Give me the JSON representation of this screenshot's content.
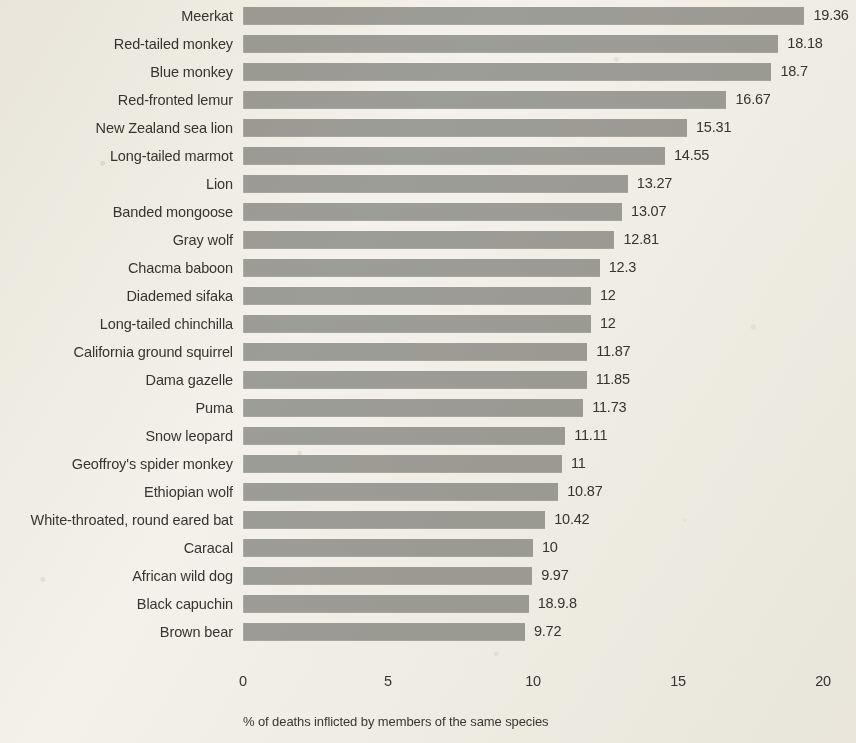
{
  "chart_data": {
    "type": "bar",
    "orientation": "horizontal",
    "title": "",
    "xlabel": "% of deaths inflicted by members of the same species",
    "ylabel": "",
    "xlim": [
      0,
      20
    ],
    "xticks": [
      "0",
      "5",
      "10",
      "15",
      "20"
    ],
    "grid": false,
    "legend": null,
    "bar_color": "#9d9d97",
    "background_color": "#f3f1ea",
    "categories": [
      "Meerkat",
      "Red-tailed monkey",
      "Blue monkey",
      "Red-fronted lemur",
      "New Zealand sea lion",
      "Long-tailed marmot",
      "Lion",
      "Banded mongoose",
      "Gray wolf",
      "Chacma baboon",
      "Diademed sifaka",
      "Long-tailed chinchilla",
      "California ground squirrel",
      "Dama gazelle",
      "Puma",
      "Snow leopard",
      "Geoffroy's spider monkey",
      "Ethiopian wolf",
      "White-throated, round eared bat",
      "Caracal",
      "African wild dog",
      "Black capuchin",
      "Brown bear"
    ],
    "values": [
      19.36,
      18.18,
      18.7,
      16.67,
      15.31,
      14.55,
      13.27,
      13.07,
      12.81,
      12.3,
      12,
      12,
      11.87,
      11.85,
      11.73,
      11.11,
      11,
      10.87,
      10.42,
      10,
      9.97,
      18.98,
      9.72
    ],
    "value_labels": [
      "19.36",
      "18.18",
      "18.7",
      "16.67",
      "15.31",
      "14.55",
      "13.27",
      "13.07",
      "12.81",
      "12.3",
      "12",
      "12",
      "11.87",
      "11.85",
      "11.73",
      "11.11",
      "11",
      "10.87",
      "10.42",
      "10",
      "9.97",
      "18.9.8",
      "9.72"
    ],
    "bar_lengths": [
      19.36,
      18.46,
      18.22,
      16.67,
      15.31,
      14.55,
      13.27,
      13.07,
      12.81,
      12.3,
      12,
      12,
      11.87,
      11.85,
      11.73,
      11.11,
      11,
      10.87,
      10.42,
      10,
      9.97,
      9.85,
      9.72
    ]
  }
}
